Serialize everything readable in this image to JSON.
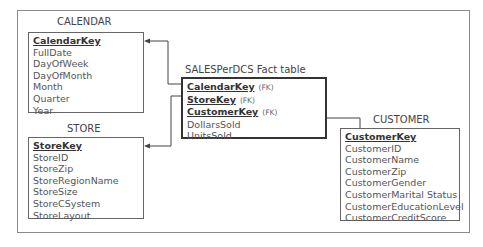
{
  "diagram": {
    "type": "star-schema",
    "entities": {
      "calendar": {
        "title": "CALENDAR",
        "key": "CalendarKey",
        "fields": [
          "FullDate",
          "DayOfWeek",
          "DayOfMonth",
          "Month",
          "Quarter",
          "Year"
        ]
      },
      "store": {
        "title": "STORE",
        "key": "StoreKey",
        "fields": [
          "StoreID",
          "StoreZip",
          "StoreRegionName",
          "StoreSize",
          "StoreCSystem",
          "StoreLayout"
        ]
      },
      "fact": {
        "title": "SALESPerDCS Fact table",
        "keys": [
          {
            "name": "CalendarKey",
            "tag": "(FK)"
          },
          {
            "name": "StoreKey",
            "tag": "(FK)"
          },
          {
            "name": "CustomerKey",
            "tag": "(FK)"
          }
        ],
        "fields": [
          "DollarsSold",
          "UnitsSold"
        ]
      },
      "customer": {
        "title": "CUSTOMER",
        "key": "CustomerKey",
        "fields": [
          "CustomerID",
          "CustomerName",
          "CustomerZip",
          "CustomerGender",
          "CustomerMarital Status",
          "CustomerEducationLevel",
          "CustomerCreditScore"
        ]
      }
    },
    "relationships": [
      {
        "from": "fact.CalendarKey",
        "to": "calendar.CalendarKey"
      },
      {
        "from": "fact.StoreKey",
        "to": "store.StoreKey"
      },
      {
        "from": "fact.CustomerKey",
        "to": "customer.CustomerKey"
      }
    ]
  }
}
